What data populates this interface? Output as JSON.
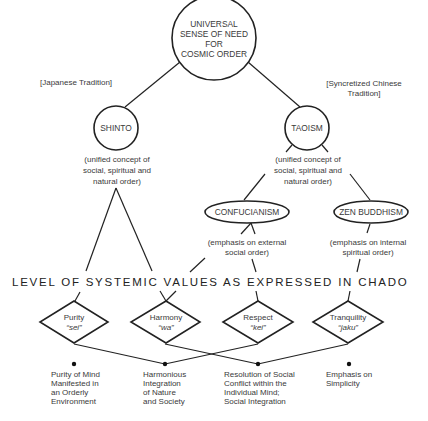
{
  "diagram": {
    "root": {
      "lines": [
        "UNIVERSAL",
        "SENSE OF NEED",
        "FOR",
        "COSMIC ORDER"
      ]
    },
    "branches": {
      "left": {
        "label": "[Japanese Tradition]"
      },
      "right": {
        "label_lines": [
          "[Syncretized Chinese",
          "Tradition]"
        ]
      }
    },
    "shinto": {
      "label": "SHINTO",
      "description": [
        "(unified concept of",
        "social, spiritual and",
        "natural order)"
      ]
    },
    "taoism": {
      "label": "TAOISM",
      "description": [
        "(unified concept of",
        "social, spiritual and",
        "natural order)"
      ]
    },
    "confucianism": {
      "label": "CONFUCIANISM",
      "description": [
        "(emphasis on external",
        "social order)"
      ]
    },
    "zen": {
      "label": "ZEN BUDDHISM",
      "description": [
        "(emphasis on internal",
        "spiritual order)"
      ]
    },
    "heading": "LEVEL OF SYSTEMIC VALUES AS EXPRESSED IN CHADO",
    "values": [
      {
        "name": "Purity",
        "term": "“sei”"
      },
      {
        "name": "Harmony",
        "term": "“wa”"
      },
      {
        "name": "Respect",
        "term": "“kei”"
      },
      {
        "name": "Tranquility",
        "term": "“jaku”"
      }
    ],
    "outcomes": [
      {
        "lines": [
          "Purity of Mind",
          "Manifested in",
          "an Orderly",
          "Environment"
        ]
      },
      {
        "lines": [
          "Harmonious",
          "Integration",
          "of Nature",
          "and Society"
        ]
      },
      {
        "lines": [
          "Resolution of Social",
          "Conflict within the",
          "Individual Mind;",
          "Social Integration"
        ]
      },
      {
        "lines": [
          "Emphasis on",
          "Simplicity"
        ]
      }
    ]
  }
}
